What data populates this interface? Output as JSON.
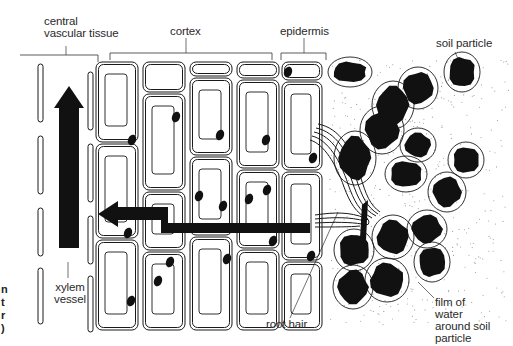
{
  "diagram": {
    "labels": {
      "central_vascular_tissue": "central\nvascular tissue",
      "cortex": "cortex",
      "epidermis": "epidermis",
      "soil_particle": "soil particle",
      "xylem_vessel": "xylem\nvessel",
      "root_hair": "root hair",
      "film_of_water": "film of\nwater\naround soil\nparticle"
    },
    "cropped_edge_text": "n\nt\nr\n)",
    "arrows": [
      {
        "name": "water-path-arrow",
        "direction": "left",
        "from": "root hair",
        "to": "xylem"
      },
      {
        "name": "xylem-flow-arrow",
        "direction": "up",
        "meaning": "water moves up xylem vessel"
      }
    ],
    "colors": {
      "ink": "#111111",
      "background": "#ffffff",
      "soil_stipple": "#9a9a9a"
    }
  }
}
